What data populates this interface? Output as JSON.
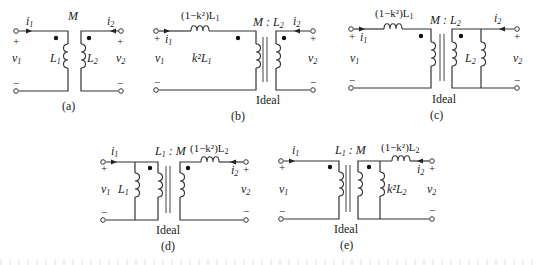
{
  "figure": {
    "panels": [
      {
        "id": "a",
        "caption": "(a)",
        "top_label": "M",
        "left_current": "i",
        "left_current_sub": "1",
        "right_current": "i",
        "right_current_sub": "2",
        "left_voltage": "v",
        "left_voltage_sub": "1",
        "right_voltage": "v",
        "right_voltage_sub": "2",
        "coil_left_label": "L",
        "coil_left_sub": "1",
        "coil_right_label": "L",
        "coil_right_sub": "2",
        "plus": "+",
        "minus": "−"
      },
      {
        "id": "b",
        "caption": "(b)",
        "series_label": "(1−k²)L",
        "series_sub": "1",
        "ratio_label": "M : L",
        "ratio_sub": "2",
        "shunt_label": "k²L",
        "shunt_sub": "1",
        "ideal_label": "Ideal",
        "left_current": "i",
        "left_current_sub": "1",
        "right_current": "i",
        "right_current_sub": "2",
        "left_voltage": "v",
        "left_voltage_sub": "1",
        "right_voltage": "v",
        "right_voltage_sub": "2",
        "plus": "+",
        "minus": "−"
      },
      {
        "id": "c",
        "caption": "(c)",
        "series_label": "(1−k²)L",
        "series_sub": "1",
        "ratio_label": "M : L",
        "ratio_sub": "2",
        "shunt_label": "L",
        "shunt_sub": "2",
        "ideal_label": "Ideal",
        "left_current": "i",
        "left_current_sub": "1",
        "right_current": "i",
        "right_current_sub": "2",
        "left_voltage": "v",
        "left_voltage_sub": "1",
        "right_voltage": "v",
        "right_voltage_sub": "2",
        "plus": "+",
        "minus": "−"
      },
      {
        "id": "d",
        "caption": "(d)",
        "series_label": "(1−k²)L",
        "series_sub": "2",
        "ratio_label": "L",
        "ratio_sub": "1",
        "ratio_suffix": " : M",
        "shunt_label": "L",
        "shunt_sub": "1",
        "ideal_label": "Ideal",
        "left_current": "i",
        "left_current_sub": "1",
        "right_current": "i",
        "right_current_sub": "2",
        "left_voltage": "v",
        "left_voltage_sub": "1",
        "right_voltage": "v",
        "right_voltage_sub": "2",
        "plus": "+",
        "minus": "−"
      },
      {
        "id": "e",
        "caption": "(e)",
        "series_label": "(1−k²)L",
        "series_sub": "2",
        "ratio_label": "L",
        "ratio_sub": "1",
        "ratio_suffix": " : M",
        "shunt_label": "k²L",
        "shunt_sub": "2",
        "ideal_label": "Ideal",
        "left_current": "i",
        "left_current_sub": "1",
        "right_current": "i",
        "right_current_sub": "2",
        "left_voltage": "v",
        "left_voltage_sub": "1",
        "right_voltage": "v",
        "right_voltage_sub": "2",
        "plus": "+",
        "minus": "−"
      }
    ]
  }
}
